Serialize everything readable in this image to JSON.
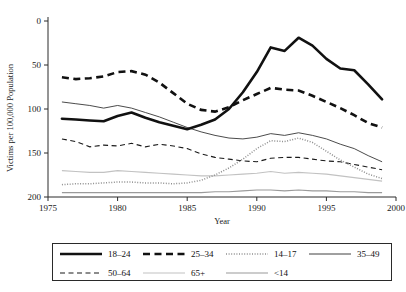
{
  "chart_data": {
    "type": "line",
    "title": "",
    "xlabel": "Year",
    "ylabel": "Victims per 100,000 Population",
    "xlim": [
      1975,
      2000
    ],
    "ylim": [
      0,
      200
    ],
    "xticks": [
      1975,
      1980,
      1985,
      1990,
      1995,
      2000
    ],
    "yticks": [
      0,
      50,
      100,
      150,
      200
    ],
    "grid": false,
    "legend_position": "below-plot",
    "x": [
      1976,
      1977,
      1978,
      1979,
      1980,
      1981,
      1982,
      1983,
      1984,
      1985,
      1986,
      1987,
      1988,
      1989,
      1990,
      1991,
      1992,
      1993,
      1994,
      1995,
      1996,
      1997,
      1998,
      1999
    ],
    "series": [
      {
        "name": "18-24",
        "style": "thick-solid",
        "values": [
          89,
          88,
          87,
          86,
          92,
          96,
          90,
          85,
          81,
          77,
          82,
          88,
          100,
          119,
          142,
          170,
          166,
          181,
          172,
          157,
          146,
          144,
          128,
          111
        ]
      },
      {
        "name": "25-34",
        "style": "thick-dashed",
        "values": [
          136,
          134,
          135,
          137,
          142,
          143,
          139,
          130,
          118,
          106,
          99,
          97,
          102,
          110,
          117,
          124,
          122,
          121,
          115,
          108,
          101,
          93,
          84,
          79
        ]
      },
      {
        "name": "14-17",
        "style": "dotted",
        "values": [
          14,
          15,
          15,
          16,
          17,
          17,
          16,
          16,
          15,
          16,
          19,
          25,
          33,
          43,
          55,
          64,
          63,
          67,
          62,
          52,
          42,
          34,
          26,
          21
        ]
      },
      {
        "name": "35-49",
        "style": "thin-solid",
        "values": [
          108,
          106,
          104,
          101,
          104,
          101,
          96,
          91,
          85,
          79,
          74,
          70,
          67,
          66,
          68,
          72,
          70,
          73,
          70,
          66,
          60,
          55,
          47,
          40
        ]
      },
      {
        "name": "50-64",
        "style": "dashed",
        "values": [
          66,
          63,
          57,
          59,
          58,
          61,
          57,
          60,
          58,
          55,
          49,
          45,
          43,
          41,
          40,
          44,
          45,
          45,
          43,
          41,
          40,
          37,
          34,
          31
        ]
      },
      {
        "name": "65+",
        "style": "fine-solid-light",
        "values": [
          30,
          29,
          28,
          28,
          30,
          29,
          28,
          27,
          26,
          25,
          24,
          24,
          25,
          26,
          27,
          29,
          27,
          28,
          27,
          26,
          24,
          22,
          20,
          18
        ]
      },
      {
        "name": "<14",
        "style": "thin-solid-light",
        "values": [
          5,
          5,
          5,
          5,
          5,
          5,
          5,
          5,
          5,
          5,
          5,
          6,
          6,
          7,
          8,
          8,
          7,
          8,
          7,
          7,
          6,
          6,
          5,
          5
        ]
      }
    ]
  },
  "axes": {
    "y_title": "Victims per 100,000 Population",
    "x_title": "Year",
    "y_tick_labels": [
      "200",
      "150",
      "100",
      "50",
      "0"
    ],
    "x_tick_labels": [
      "1975",
      "1980",
      "1985",
      "1990",
      "1995",
      "2000"
    ]
  },
  "legend": {
    "rows": [
      [
        {
          "label": "18–24",
          "style": "thick-solid"
        },
        {
          "label": "25–34",
          "style": "thick-dashed"
        },
        {
          "label": "14–17",
          "style": "dotted"
        },
        {
          "label": "35–49",
          "style": "thin-solid"
        }
      ],
      [
        {
          "label": "50–64",
          "style": "dashed"
        },
        {
          "label": "65+",
          "style": "fine-solid-light"
        },
        {
          "label": "<14",
          "style": "thin-solid-light"
        }
      ]
    ]
  },
  "colors": {
    "ink": "#111111",
    "axis": "#2a2a2a",
    "light_gray": "#9a9a9a",
    "pale_gray": "#c2c2c2",
    "background": "#ffffff"
  }
}
